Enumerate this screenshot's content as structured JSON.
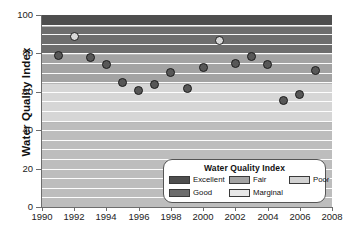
{
  "chart_data": {
    "type": "scatter",
    "title": "",
    "xlabel": "",
    "ylabel": "Water Quality Index",
    "xlim": [
      1990,
      2008
    ],
    "ylim": [
      0,
      100
    ],
    "grid": true,
    "xticks": [
      "1990",
      "1992",
      "1994",
      "1996",
      "1998",
      "2000",
      "2002",
      "2004",
      "2006",
      "2008"
    ],
    "yticks": [
      "0",
      "20",
      "40",
      "60",
      "80",
      "100"
    ],
    "x": [
      1991,
      1992,
      1993,
      1994,
      1995,
      1996,
      1997,
      1998,
      1999,
      2000,
      2001,
      2002,
      2003,
      2004,
      2005,
      2006,
      2007
    ],
    "values": [
      79.0,
      89.0,
      78.0,
      74.0,
      65.0,
      60.5,
      64.0,
      70.0,
      61.5,
      72.5,
      86.5,
      75.0,
      78.5,
      74.0,
      55.5,
      58.5,
      71.0
    ],
    "marker_styles": [
      "filled",
      "open",
      "filled",
      "filled",
      "filled",
      "filled",
      "filled",
      "filled",
      "filled",
      "filled",
      "open",
      "filled",
      "filled",
      "filled",
      "filled",
      "filled",
      "filled"
    ],
    "points": [
      {
        "year": 1991,
        "value": 79.0,
        "marker": "filled",
        "band": "Fair"
      },
      {
        "year": 1992,
        "value": 89.0,
        "marker": "open",
        "band": "Good"
      },
      {
        "year": 1993,
        "value": 78.0,
        "marker": "filled",
        "band": "Fair"
      },
      {
        "year": 1994,
        "value": 74.0,
        "marker": "filled",
        "band": "Fair"
      },
      {
        "year": 1995,
        "value": 65.0,
        "marker": "filled",
        "band": "Fair"
      },
      {
        "year": 1996,
        "value": 60.5,
        "marker": "filled",
        "band": "Marginal"
      },
      {
        "year": 1997,
        "value": 64.0,
        "marker": "filled",
        "band": "Marginal"
      },
      {
        "year": 1998,
        "value": 70.0,
        "marker": "filled",
        "band": "Fair"
      },
      {
        "year": 1999,
        "value": 61.5,
        "marker": "filled",
        "band": "Marginal"
      },
      {
        "year": 2000,
        "value": 72.5,
        "marker": "filled",
        "band": "Fair"
      },
      {
        "year": 2001,
        "value": 86.5,
        "marker": "open",
        "band": "Good"
      },
      {
        "year": 2002,
        "value": 75.0,
        "marker": "filled",
        "band": "Fair"
      },
      {
        "year": 2003,
        "value": 78.5,
        "marker": "filled",
        "band": "Fair"
      },
      {
        "year": 2004,
        "value": 74.0,
        "marker": "filled",
        "band": "Fair"
      },
      {
        "year": 2005,
        "value": 55.5,
        "marker": "filled",
        "band": "Marginal"
      },
      {
        "year": 2006,
        "value": 58.5,
        "marker": "filled",
        "band": "Marginal"
      },
      {
        "year": 2007,
        "value": 71.0,
        "marker": "filled",
        "band": "Fair"
      }
    ],
    "bands": [
      {
        "name": "Excellent",
        "from": 95,
        "to": 100,
        "color": "#4e4e4e"
      },
      {
        "name": "Good",
        "from": 80,
        "to": 94,
        "color": "#6d6d6d"
      },
      {
        "name": "Fair",
        "from": 65,
        "to": 79,
        "color": "#a3a3a3"
      },
      {
        "name": "Marginal",
        "from": 45,
        "to": 64,
        "color": "#d6d6d6"
      },
      {
        "name": "Poor",
        "from": 0,
        "to": 44,
        "color": "#bdbdbd"
      }
    ],
    "gridlines": [
      5,
      10,
      15,
      20,
      25,
      30,
      35,
      40,
      45,
      50,
      55,
      60,
      65,
      70,
      75,
      80,
      85,
      90,
      95
    ]
  },
  "legend": {
    "title": "Water Quality Index",
    "position": "inside-bottom-right",
    "items": [
      {
        "label": "Excellent",
        "color": "#4e4e4e"
      },
      {
        "label": "Good",
        "color": "#6d6d6d"
      },
      {
        "label": "Fair",
        "color": "#a3a3a3"
      },
      {
        "label": "Marginal",
        "color": "#e8e8e8"
      },
      {
        "label": "Poor",
        "color": "#d2d2d2"
      }
    ]
  },
  "colors": {
    "axis": "#6d6d6d",
    "text": "#111111",
    "gridline": "#ffffff",
    "marker_fill": "#575757",
    "marker_open_fill": "#d8d8d8",
    "marker_edge": "#1d1d1d",
    "background": "#ffffff"
  }
}
